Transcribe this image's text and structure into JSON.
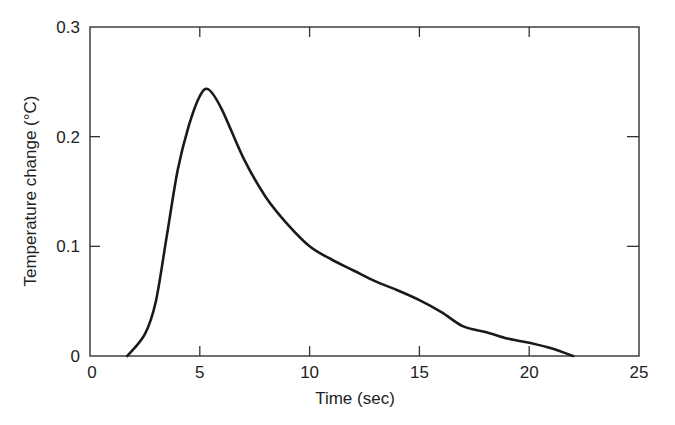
{
  "chart_data": {
    "type": "line",
    "title": "",
    "xlabel": "Time (sec)",
    "ylabel": "Temperature change (°C)",
    "xlim": [
      0,
      25
    ],
    "ylim": [
      0,
      0.3
    ],
    "xticks": [
      0,
      5,
      10,
      15,
      20,
      25
    ],
    "yticks": [
      0,
      0.1,
      0.2,
      0.3
    ],
    "xtick_labels": [
      "0",
      "5",
      "10",
      "15",
      "20",
      "25"
    ],
    "ytick_labels": [
      "0",
      "0.1",
      "0.2",
      "0.3"
    ],
    "grid": false,
    "legend": null,
    "series": [
      {
        "name": "Temperature change",
        "color": "#1a1a1a",
        "x": [
          1.7,
          2.5,
          3.0,
          3.5,
          4.0,
          4.5,
          5.0,
          5.4,
          6.0,
          7.0,
          8.0,
          9.0,
          10.0,
          11.0,
          12.0,
          13.0,
          14.0,
          15.0,
          16.0,
          17.0,
          18.0,
          19.0,
          20.0,
          21.0,
          22.0
        ],
        "y": [
          0.0,
          0.02,
          0.05,
          0.11,
          0.17,
          0.21,
          0.237,
          0.243,
          0.225,
          0.18,
          0.145,
          0.12,
          0.1,
          0.088,
          0.078,
          0.068,
          0.06,
          0.051,
          0.04,
          0.027,
          0.022,
          0.016,
          0.012,
          0.007,
          0.0
        ]
      }
    ]
  }
}
